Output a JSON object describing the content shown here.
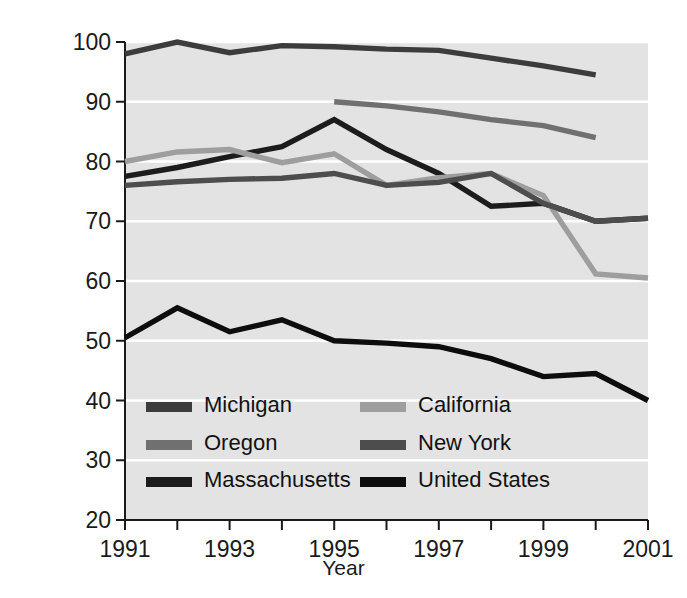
{
  "chart_data": {
    "type": "line",
    "title": "",
    "xlabel": "Year",
    "ylabel": "Percent container redemption rate",
    "xlim": [
      1991,
      2001
    ],
    "ylim": [
      20,
      100
    ],
    "x_ticks": [
      1991,
      1992,
      1993,
      1994,
      1995,
      1996,
      1997,
      1998,
      1999,
      2000,
      2001
    ],
    "x_tick_labels": [
      "1991",
      "",
      "1993",
      "",
      "1995",
      "",
      "1997",
      "",
      "1999",
      "",
      "2001"
    ],
    "y_ticks": [
      20,
      30,
      40,
      50,
      60,
      70,
      80,
      90,
      100
    ],
    "y_tick_labels": [
      "20",
      "30",
      "40",
      "50",
      "60",
      "70",
      "80",
      "90",
      "100"
    ],
    "grid": true,
    "grid_color": "#ffffff",
    "plot_bg": "#e3e3e3",
    "legend_position": "inside-bottom-left",
    "legend_columns": 2,
    "series": [
      {
        "name": "Michigan",
        "color": "#3c3c3c",
        "x": [
          1991,
          1992,
          1993,
          1994,
          1995,
          1996,
          1997,
          1998,
          1999,
          2000
        ],
        "values": [
          98.0,
          100.0,
          98.2,
          99.4,
          99.2,
          98.8,
          98.6,
          97.3,
          96.0,
          94.5
        ]
      },
      {
        "name": "Oregon",
        "color": "#707070",
        "x": [
          1995,
          1996,
          1997,
          1998,
          1999,
          2000
        ],
        "values": [
          90.0,
          89.3,
          88.3,
          87.0,
          86.0,
          84.0
        ]
      },
      {
        "name": "Massachusetts",
        "color": "#1c1c1c",
        "x": [
          1991,
          1992,
          1993,
          1994,
          1995,
          1996,
          1997,
          1998,
          1999,
          2000,
          2001
        ],
        "values": [
          77.5,
          79.0,
          80.8,
          82.5,
          87.0,
          82.0,
          78.0,
          72.5,
          73.0,
          70.0,
          70.5
        ]
      },
      {
        "name": "California",
        "color": "#9e9e9e",
        "x": [
          1991,
          1992,
          1993,
          1994,
          1995,
          1996,
          1997,
          1998,
          1999,
          2000,
          2001
        ],
        "values": [
          80.0,
          81.6,
          82.0,
          79.8,
          81.3,
          76.0,
          77.3,
          78.0,
          74.3,
          61.2,
          60.5
        ]
      },
      {
        "name": "New York",
        "color": "#4d4d4d",
        "x": [
          1991,
          1992,
          1993,
          1994,
          1995,
          1996,
          1997,
          1998,
          1999,
          2000,
          2001
        ],
        "values": [
          76.0,
          76.6,
          77.0,
          77.2,
          78.0,
          76.0,
          76.5,
          78.0,
          73.0,
          70.0,
          70.5
        ]
      },
      {
        "name": "United States",
        "color": "#0d0d0d",
        "x": [
          1991,
          1992,
          1993,
          1994,
          1995,
          1996,
          1997,
          1998,
          1999,
          2000,
          2001
        ],
        "values": [
          50.5,
          55.5,
          51.5,
          53.5,
          50.0,
          49.6,
          49.0,
          47.0,
          44.0,
          44.5,
          40.0
        ]
      }
    ]
  },
  "legend": {
    "items": [
      {
        "label": "Michigan",
        "color": "#3c3c3c"
      },
      {
        "label": "California",
        "color": "#9e9e9e"
      },
      {
        "label": "Oregon",
        "color": "#707070"
      },
      {
        "label": "New York",
        "color": "#4d4d4d"
      },
      {
        "label": "Massachusetts",
        "color": "#1c1c1c"
      },
      {
        "label": "United States",
        "color": "#0d0d0d"
      }
    ]
  },
  "axes": {
    "y_title": "Percent container redemption rate",
    "x_title": "Year"
  }
}
